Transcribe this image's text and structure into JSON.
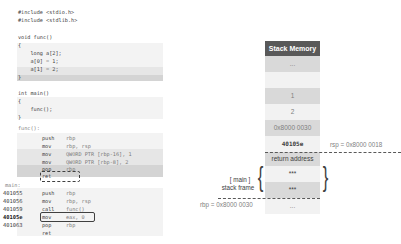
{
  "c_source": {
    "lines": [
      "#include <stdio.h>",
      "#include <stdlib.h>",
      "",
      "void func()",
      "{",
      "    long a[2];",
      "    a[0] = 1;",
      "    a[1] = 2;",
      "}",
      "",
      "int main()",
      "{",
      "    func();",
      "}"
    ]
  },
  "assembly": {
    "func_label": "func():",
    "func_instructions": [
      {
        "op": "push",
        "arg": "rbp"
      },
      {
        "op": "mov",
        "arg": "rbp, rsp"
      },
      {
        "op": "mov",
        "arg": "QWORD PTR [rbp-16], 1"
      },
      {
        "op": "mov",
        "arg": "QWORD PTR [rbp-8], 2"
      },
      {
        "op": "pop",
        "arg": "rbp"
      },
      {
        "op": "ret",
        "arg": ""
      }
    ],
    "main_label": "main:",
    "main_instructions": [
      {
        "addr": "401055",
        "op": "push",
        "arg": "rbp"
      },
      {
        "addr": "401056",
        "op": "mov",
        "arg": "rbp, rsp"
      },
      {
        "addr": "401059",
        "op": "call",
        "arg": "func()"
      },
      {
        "addr": "40105e",
        "op": "mov",
        "arg": "eax, 0"
      },
      {
        "addr": "401063",
        "op": "pop",
        "arg": "rbp"
      },
      {
        "addr": "",
        "op": "ret",
        "arg": ""
      }
    ]
  },
  "stack": {
    "title": "Stack Memory",
    "cells": [
      "...",
      "",
      "1",
      "2",
      "0x8000 0030",
      "40105e",
      "return address",
      "***",
      "***",
      "..."
    ],
    "rsp_label": "rsp = 0x8000 0018",
    "rbp_label": "rbp = 0x8000 0030",
    "frame_label_1": "[ main ]",
    "frame_label_2": "stack frame"
  },
  "colors": {
    "header_bg": "#595959",
    "cell_gray": "#d9d9d9",
    "cell_light": "#f2f2f2",
    "highlight_dark": "#d4d4d4"
  }
}
